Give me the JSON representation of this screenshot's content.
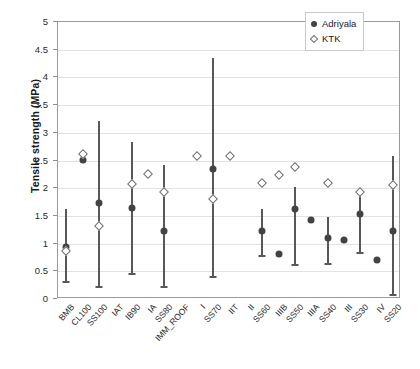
{
  "chart_data": {
    "type": "scatter",
    "title": "",
    "xlabel": "",
    "ylabel": "Tensile strength (MPa)",
    "ylim": [
      0,
      5
    ],
    "yticks": [
      0,
      0.5,
      1,
      1.5,
      2,
      2.5,
      3,
      3.5,
      4,
      4.5,
      5
    ],
    "ytick_labels": [
      "0",
      "0.5",
      "1",
      "1.5",
      "2",
      "2.5",
      "3",
      "3.5",
      "4",
      "4.5",
      "5"
    ],
    "grid": "horizontal",
    "legend_position": "top-right",
    "legend": [
      {
        "name": "Adriyala",
        "marker": "filled-circle",
        "color": "#434345"
      },
      {
        "name": "KTK",
        "marker": "open-diamond",
        "color": "#6e6e70"
      }
    ],
    "categories": [
      "BMB",
      "CL100",
      "SS100",
      "IAT",
      "IB90",
      "IA",
      "SS80",
      "IMM_ROOF",
      "I",
      "SS70",
      "IIT",
      "II",
      "SS60",
      "IIIB",
      "SS50",
      "IIIA",
      "SS40",
      "III",
      "SS30",
      "IV",
      "SS20"
    ],
    "series": [
      {
        "name": "Adriyala",
        "marker": "filled-circle",
        "points": [
          {
            "category": "BMB",
            "value": 0.93,
            "low": 0.3,
            "high": 1.62
          },
          {
            "category": "CL100",
            "value": 2.51,
            "low": null,
            "high": null
          },
          {
            "category": "SS100",
            "value": 1.73,
            "low": 0.22,
            "high": 3.22
          },
          {
            "category": "IAT",
            "value": null,
            "low": null,
            "high": null
          },
          {
            "category": "IB90",
            "value": 1.64,
            "low": 0.45,
            "high": 2.83
          },
          {
            "category": "IA",
            "value": null,
            "low": null,
            "high": null
          },
          {
            "category": "SS80",
            "value": 1.23,
            "low": 0.22,
            "high": 2.42
          },
          {
            "category": "IMM_ROOF",
            "value": null,
            "low": null,
            "high": null
          },
          {
            "category": "I",
            "value": null,
            "low": null,
            "high": null
          },
          {
            "category": "SS70",
            "value": 2.34,
            "low": 0.4,
            "high": 4.35
          },
          {
            "category": "IIT",
            "value": null,
            "low": null,
            "high": null
          },
          {
            "category": "II",
            "value": null,
            "low": null,
            "high": null
          },
          {
            "category": "SS60",
            "value": 1.22,
            "low": 0.78,
            "high": 1.63
          },
          {
            "category": "IIIB",
            "value": 0.82,
            "low": null,
            "high": null
          },
          {
            "category": "SS50",
            "value": 1.62,
            "low": 0.62,
            "high": 2.02
          },
          {
            "category": "IIIA",
            "value": 1.42,
            "low": null,
            "high": null
          },
          {
            "category": "SS40",
            "value": 1.1,
            "low": 0.63,
            "high": 1.48
          },
          {
            "category": "III",
            "value": 1.07,
            "low": null,
            "high": null
          },
          {
            "category": "SS30",
            "value": 1.54,
            "low": 0.83,
            "high": 1.92
          },
          {
            "category": "IV",
            "value": 0.7,
            "low": null,
            "high": null
          },
          {
            "category": "SS20",
            "value": 1.22,
            "low": 0.08,
            "high": 2.58
          }
        ]
      },
      {
        "name": "KTK",
        "marker": "open-diamond",
        "points": [
          {
            "category": "BMB",
            "value": 0.86
          },
          {
            "category": "CL100",
            "value": 2.62
          },
          {
            "category": "SS100",
            "value": 1.32
          },
          {
            "category": "IB90",
            "value": 2.07
          },
          {
            "category": "IA",
            "value": 2.25
          },
          {
            "category": "SS80",
            "value": 1.93
          },
          {
            "category": "I",
            "value": 2.58
          },
          {
            "category": "SS70",
            "value": 1.8
          },
          {
            "category": "IIT",
            "value": 2.58
          },
          {
            "category": "SS60",
            "value": 2.09
          },
          {
            "category": "IIIB",
            "value": 2.23
          },
          {
            "category": "SS50",
            "value": 2.38
          },
          {
            "category": "SS40",
            "value": 2.09
          },
          {
            "category": "SS30",
            "value": 1.93
          },
          {
            "category": "SS20",
            "value": 2.06
          }
        ]
      }
    ]
  }
}
